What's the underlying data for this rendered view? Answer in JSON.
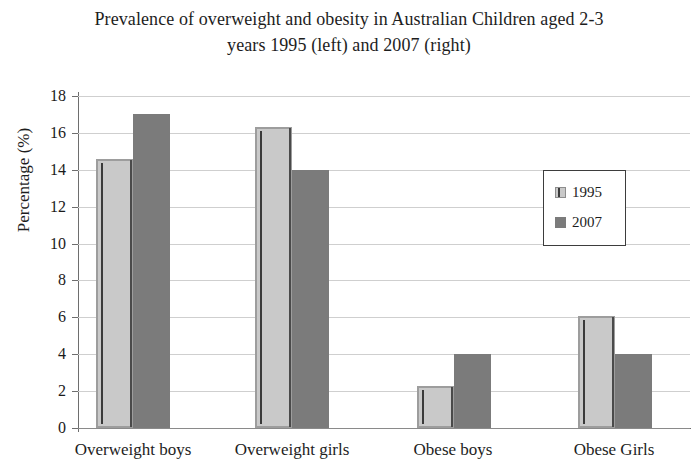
{
  "chart_data": {
    "type": "bar",
    "title": "Prevalence of overweight and obesity in Australian Children aged 2-3 years 1995 (left) and 2007 (right)",
    "title_line1": "Prevalence of overweight and obesity in Australian Children aged 2-3",
    "title_line2": "years 1995 (left) and 2007 (right)",
    "xlabel": "",
    "ylabel": "Percentage (%)",
    "categories": [
      "Overweight boys",
      "Overweight girls",
      "Obese boys",
      "Obese Girls"
    ],
    "series": [
      {
        "name": "1995",
        "color": "#c9c9c9",
        "values": [
          14.6,
          16.3,
          2.3,
          6.1
        ]
      },
      {
        "name": "2007",
        "color": "#7b7b7b",
        "values": [
          17.0,
          14.0,
          4.0,
          4.0
        ]
      }
    ],
    "ylim": [
      0,
      18
    ],
    "ytick_labels": [
      "18",
      "16",
      "14",
      "12",
      "10",
      "8",
      "6",
      "4",
      "2",
      "0"
    ],
    "ytick_values": [
      18,
      16,
      14,
      12,
      10,
      8,
      6,
      4,
      2,
      0
    ],
    "ystep": 2,
    "grid": true,
    "legend_position": "center-right",
    "legend_entries": [
      "1995",
      "2007"
    ]
  }
}
